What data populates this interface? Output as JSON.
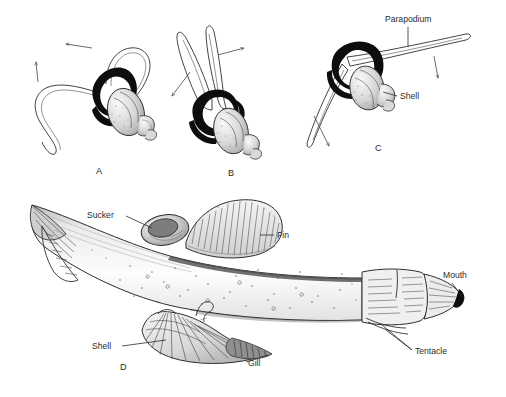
{
  "figure": {
    "background_color": "#ffffff",
    "ink_color": "#2b2b2b",
    "width": 506,
    "height": 397,
    "style": "pen-and-ink scientific illustration, stippled and line-hatched"
  },
  "panels": [
    {
      "id": "A",
      "letter": "A",
      "letter_x": 96,
      "letter_y": 174,
      "subject": "shelled pteropod with parapodia spread in downstroke",
      "arrows": [
        {
          "name": "motion-arrow-left",
          "direction": "left"
        },
        {
          "name": "motion-arrow-up",
          "direction": "up"
        }
      ]
    },
    {
      "id": "B",
      "letter": "B",
      "letter_x": 228,
      "letter_y": 176,
      "subject": "shelled pteropod with parapodia swept upward together",
      "arrows": [
        {
          "name": "motion-arrow-upright",
          "direction": "up-right"
        },
        {
          "name": "motion-arrow-downleft",
          "direction": "down-left"
        }
      ]
    },
    {
      "id": "C",
      "letter": "C",
      "letter_x": 378,
      "letter_y": 150,
      "subject": "shelled pteropod with parapodia extended as straight blade",
      "arrows": [
        {
          "name": "motion-arrow-down-right",
          "direction": "down"
        },
        {
          "name": "motion-arrow-down-left",
          "direction": "down"
        }
      ]
    },
    {
      "id": "D",
      "letter": "D",
      "letter_x": 124,
      "letter_y": 367,
      "subject": "large elongate heteropod mollusk, lateral view"
    }
  ],
  "labels": {
    "parapodium": {
      "text": "Parapodium",
      "x": 385,
      "y": 22,
      "panel": "C"
    },
    "shell_c": {
      "text": "Shell",
      "x": 397,
      "y": 99,
      "panel": "C"
    },
    "sucker": {
      "text": "Sucker",
      "x": 87,
      "y": 215,
      "panel": "D"
    },
    "fin": {
      "text": "Fin",
      "x": 275,
      "y": 235,
      "panel": "D"
    },
    "mouth": {
      "text": "Mouth",
      "x": 443,
      "y": 276,
      "panel": "D"
    },
    "tentacle": {
      "text": "Tentacle",
      "x": 415,
      "y": 352,
      "panel": "D"
    },
    "shell_d": {
      "text": "Shell",
      "x": 92,
      "y": 346,
      "panel": "D"
    },
    "gill": {
      "text": "Gill",
      "x": 246,
      "y": 364,
      "panel": "D"
    }
  }
}
